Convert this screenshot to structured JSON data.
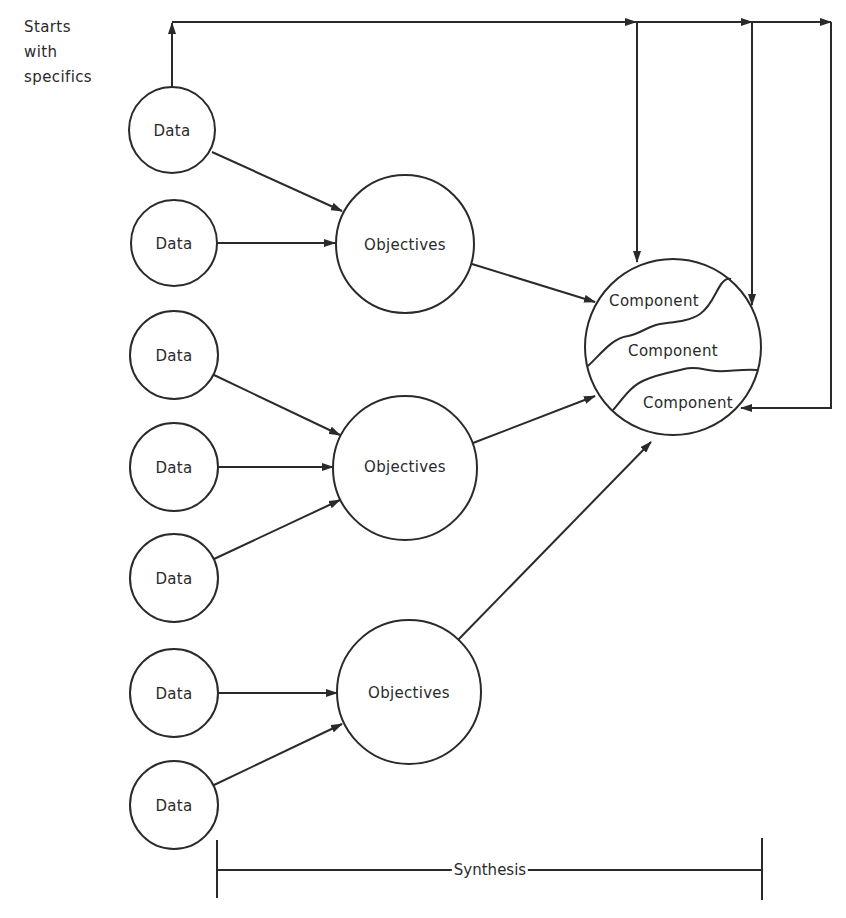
{
  "side_note": {
    "lines": [
      "Starts",
      "with",
      "specifics"
    ]
  },
  "data_nodes": [
    {
      "label": "Data",
      "cx": 172,
      "cy": 130
    },
    {
      "label": "Data",
      "cx": 174,
      "cy": 243
    },
    {
      "label": "Data",
      "cx": 174,
      "cy": 355
    },
    {
      "label": "Data",
      "cx": 174,
      "cy": 467
    },
    {
      "label": "Data",
      "cx": 174,
      "cy": 578
    },
    {
      "label": "Data",
      "cx": 174,
      "cy": 693
    },
    {
      "label": "Data",
      "cx": 174,
      "cy": 805
    }
  ],
  "objective_nodes": [
    {
      "label": "Objectives",
      "cx": 405,
      "cy": 244
    },
    {
      "label": "Objectives",
      "cx": 405,
      "cy": 468
    },
    {
      "label": "Objectives",
      "cx": 409,
      "cy": 692
    }
  ],
  "system_node": {
    "components": [
      "Component",
      "Component",
      "Component"
    ]
  },
  "synthesis_label": "Synthesis",
  "colors": {
    "line": "#2a2a2a",
    "background": "#ffffff"
  }
}
